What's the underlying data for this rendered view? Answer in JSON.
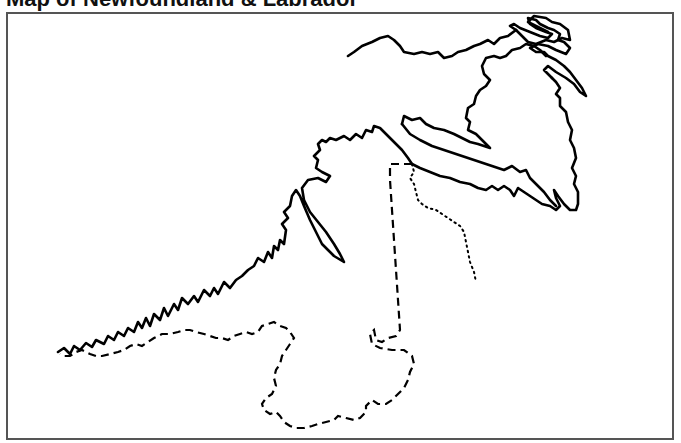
{
  "title": "Map of Newfoundland & Labrador",
  "map": {
    "style": "outline",
    "line_color": "#000000",
    "frame_color": "#555555",
    "background": "#ffffff",
    "features": [
      {
        "name": "Labrador coastline",
        "line": "solid"
      },
      {
        "name": "Newfoundland island coastline",
        "line": "solid"
      },
      {
        "name": "Quebec–Labrador boundary",
        "line": "dashed"
      },
      {
        "name": "Inland boundary",
        "line": "dotted"
      }
    ]
  }
}
